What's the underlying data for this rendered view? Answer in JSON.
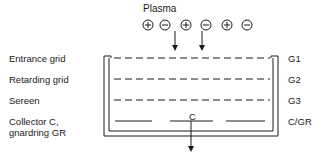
{
  "diagram": {
    "title": "Plasma",
    "particles": [
      "+",
      "−",
      "+",
      "−",
      "+",
      "−"
    ],
    "left_labels": [
      {
        "id": "entrance",
        "text": "Entrance grid"
      },
      {
        "id": "retarding",
        "text": "Retarding grid"
      },
      {
        "id": "screen",
        "text": "Sereen"
      },
      {
        "id": "collector_1",
        "text": "Collector C,"
      },
      {
        "id": "collector_2",
        "text": "gnardring GR"
      }
    ],
    "right_labels": [
      "G1",
      "G2",
      "G3",
      "C/GR"
    ],
    "collector_label": "C"
  }
}
